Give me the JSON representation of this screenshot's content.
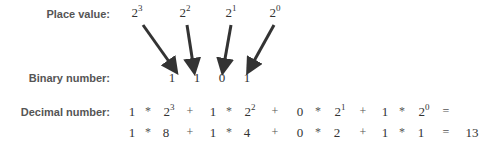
{
  "labels": {
    "place_value": "Place value:",
    "binary_number": "Binary number:",
    "decimal_number": "Decimal number:"
  },
  "place_values": [
    {
      "base": "2",
      "exp": "3"
    },
    {
      "base": "2",
      "exp": "2"
    },
    {
      "base": "2",
      "exp": "1"
    },
    {
      "base": "2",
      "exp": "0"
    }
  ],
  "binary_digits": [
    "1",
    "1",
    "0",
    "1"
  ],
  "decimal_row1": {
    "terms": [
      {
        "digit": "1",
        "base": "2",
        "exp": "3"
      },
      {
        "digit": "1",
        "base": "2",
        "exp": "2"
      },
      {
        "digit": "0",
        "base": "2",
        "exp": "1"
      },
      {
        "digit": "1",
        "base": "2",
        "exp": "0"
      }
    ],
    "times": "*",
    "plus": "+",
    "equals": "="
  },
  "decimal_row2": {
    "terms": [
      {
        "digit": "1",
        "value": "8"
      },
      {
        "digit": "1",
        "value": "4"
      },
      {
        "digit": "0",
        "value": "2"
      },
      {
        "digit": "1",
        "value": "1"
      }
    ],
    "times": "*",
    "plus": "+",
    "equals": "=",
    "result": "13"
  },
  "colors": {
    "arrow": "#333333",
    "label": "#555555",
    "text": "#333333"
  }
}
